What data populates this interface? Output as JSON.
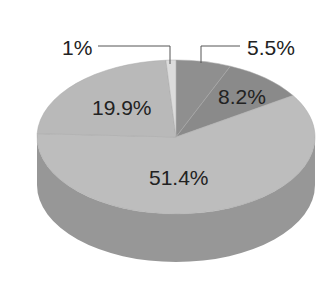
{
  "chart_data": {
    "type": "pie",
    "style": "3d",
    "title": "",
    "slices": [
      {
        "label": "5.5%",
        "value": 5.5,
        "color": "#8f8f8f"
      },
      {
        "label": "8.2%",
        "value": 8.2,
        "color": "#8a8a8a"
      },
      {
        "label": "51.4%",
        "value": 51.4,
        "color": "#bdbdbd"
      },
      {
        "label": "19.9%",
        "value": 19.9,
        "color": "#b9b9b9"
      },
      {
        "label": "1%",
        "value": 1.0,
        "color": "#dcdcdc"
      }
    ],
    "side_color": "#979797",
    "legend": "none",
    "leader_lines": [
      "1%",
      "5.5%"
    ]
  },
  "labels": {
    "s1": "1%",
    "s55": "5.5%",
    "s82": "8.2%",
    "s199": "19.9%",
    "s514": "51.4%"
  }
}
